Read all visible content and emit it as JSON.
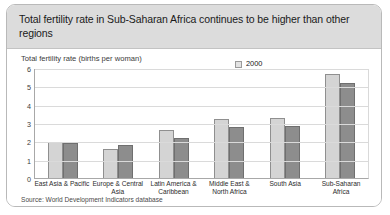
{
  "card": {
    "title": "Total fertility rate in Sub-Saharan Africa continues to be higher than other regions",
    "source": "Source: World Development Indicators database"
  },
  "colors": {
    "header_bg": "#dcdcdc",
    "card_border": "#b9b9b9",
    "series_2000": "#d4d4d4",
    "series_2008": "#8d8d8d",
    "gridline": "#dadada",
    "axis": "#a8a8a8"
  },
  "legend": {
    "position": "top-right",
    "entries": [
      {
        "label": "2000",
        "color": "#d4d4d4"
      },
      {
        "label": "2008",
        "color": "#8d8d8d"
      }
    ]
  },
  "chart_data": {
    "type": "bar",
    "title": "Total fertility rate in Sub-Saharan Africa continues to be higher than other regions",
    "subtitle": "",
    "ylabel": "Total fertility rate (births per woman)",
    "xlabel": "",
    "ylim": [
      0,
      6
    ],
    "yticks": [
      0,
      1,
      2,
      3,
      4,
      5,
      6
    ],
    "ytick_labels": [
      "0",
      "1",
      "2",
      "3",
      "4",
      "5",
      "6"
    ],
    "grid": true,
    "legend_position": "top-right",
    "categories": [
      "East Asia & Pacific",
      "Europe & Central Asia",
      "Latin America & Caribbean",
      "Middle East & North Africa",
      "South Asia",
      "Sub-Saharan Africa"
    ],
    "series": [
      {
        "name": "2000",
        "color": "#d4d4d4",
        "values": [
          1.95,
          1.6,
          2.6,
          3.2,
          3.3,
          5.7
        ]
      },
      {
        "name": "2008",
        "color": "#8d8d8d",
        "values": [
          1.9,
          1.8,
          2.2,
          2.8,
          2.85,
          5.2
        ]
      }
    ],
    "source": "Source: World Development Indicators database"
  }
}
